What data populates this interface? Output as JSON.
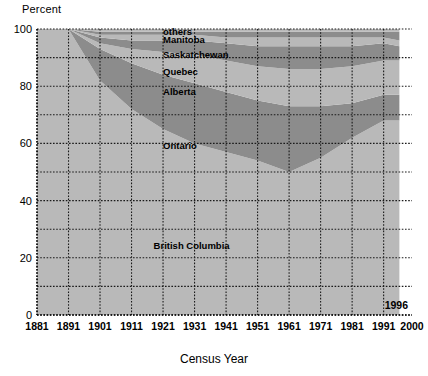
{
  "chart_data": {
    "type": "area",
    "title": "",
    "xlabel": "Census Year",
    "ylabel": "Percent",
    "xlim": [
      1881,
      2000
    ],
    "ylim": [
      0,
      100
    ],
    "grid": true,
    "legend_position": "inline-labels",
    "stacked": true,
    "stack_order": "bottom-to-top",
    "x": [
      1881,
      1891,
      1901,
      1911,
      1921,
      1931,
      1941,
      1951,
      1961,
      1971,
      1981,
      1991,
      1996
    ],
    "x_ticks": [
      "1881",
      "1891",
      "1901",
      "1911",
      "1921",
      "1931",
      "1941",
      "1951",
      "1961",
      "1971",
      "1981",
      "1991",
      "2000"
    ],
    "y_ticks": [
      "0",
      "20",
      "40",
      "60",
      "80",
      "100"
    ],
    "y_ticks_minor": [
      "10",
      "30",
      "50",
      "70",
      "90"
    ],
    "annotation_end": "1996",
    "series": [
      {
        "name": "British Columbia",
        "color": "#b9b9b9",
        "values": [
          100,
          100,
          82,
          72,
          65,
          60,
          57,
          54,
          50,
          55,
          62,
          68,
          68
        ]
      },
      {
        "name": "Ontario",
        "color": "#8c8c8c",
        "values": [
          0,
          0,
          11,
          16,
          19,
          21,
          21,
          21,
          23,
          18,
          12,
          9,
          9
        ]
      },
      {
        "name": "Alberta",
        "color": "#b9b9b9",
        "values": [
          0,
          0,
          2,
          5,
          8,
          10,
          11,
          12,
          13,
          13,
          13,
          12,
          12
        ]
      },
      {
        "name": "Quebec",
        "color": "#8c8c8c",
        "values": [
          0,
          0,
          2,
          3,
          4,
          5,
          6,
          7,
          8,
          8,
          7,
          6,
          5
        ]
      },
      {
        "name": "Saskatchewan",
        "color": "#b9b9b9",
        "values": [
          0,
          0,
          1,
          2,
          2,
          2,
          2,
          3,
          3,
          3,
          3,
          2,
          2
        ]
      },
      {
        "name": "Manitoba",
        "color": "#8c8c8c",
        "values": [
          0,
          0,
          1,
          1,
          1,
          1,
          2,
          2,
          2,
          2,
          2,
          2,
          3
        ]
      },
      {
        "name": "others",
        "color": "#b9b9b9",
        "values": [
          0,
          0,
          1,
          1,
          1,
          1,
          1,
          1,
          1,
          1,
          1,
          1,
          1
        ]
      }
    ],
    "series_label_positions": [
      {
        "name": "others",
        "x": 1921,
        "y": 99
      },
      {
        "name": "Manitoba",
        "x": 1921,
        "y": 96
      },
      {
        "name": "Saskatchewan",
        "x": 1921,
        "y": 91
      },
      {
        "name": "Quebec",
        "x": 1921,
        "y": 85
      },
      {
        "name": "Alberta",
        "x": 1921,
        "y": 78
      },
      {
        "name": "Ontario",
        "x": 1921,
        "y": 59
      },
      {
        "name": "British Columbia",
        "x": 1918,
        "y": 24
      }
    ]
  },
  "labels": {
    "ylabel": "Percent",
    "xlabel": "Census Year",
    "annotation_end": "1996"
  }
}
